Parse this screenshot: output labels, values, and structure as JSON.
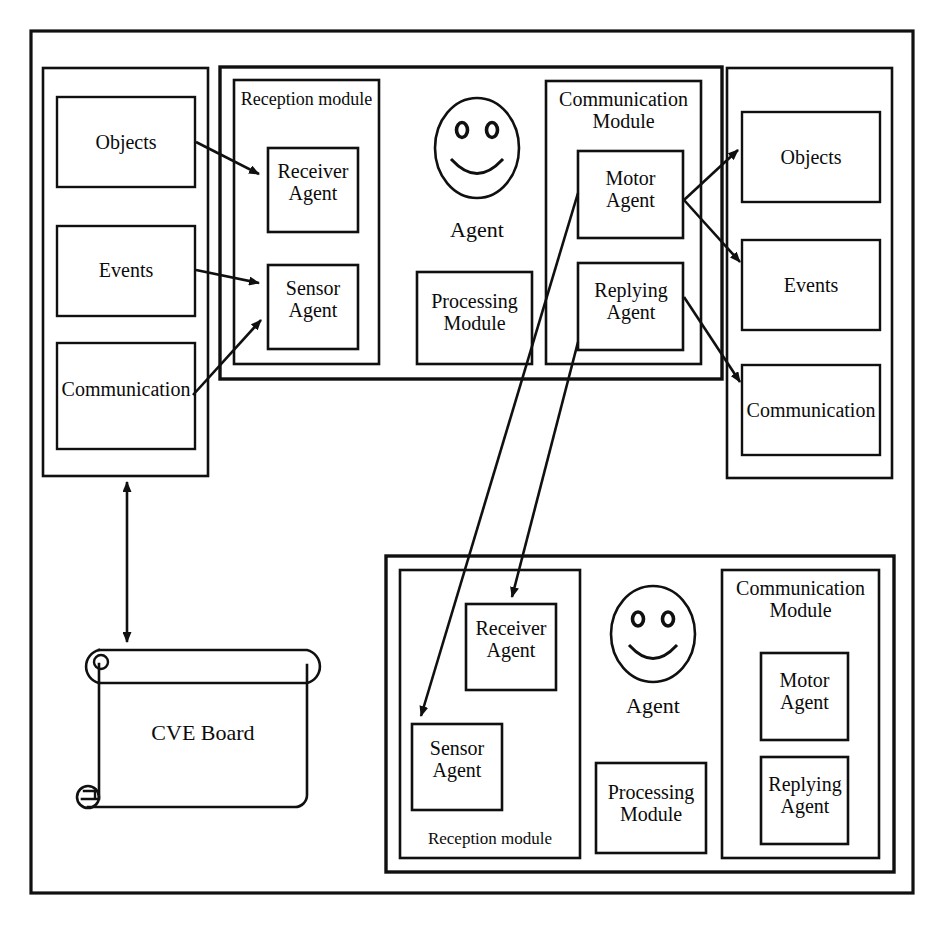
{
  "diagram": {
    "stroke_color": "#101010",
    "background_color": "#ffffff"
  },
  "left_repository": {
    "name": "left-repository-container",
    "items": [
      {
        "label": "Objects"
      },
      {
        "label": "Events"
      },
      {
        "label": "Communication"
      }
    ]
  },
  "right_repository": {
    "name": "right-repository-container",
    "items": [
      {
        "label": "Objects"
      },
      {
        "label": "Events"
      },
      {
        "label": "Communication"
      }
    ]
  },
  "top_agent": {
    "label": "Agent",
    "reception_module": {
      "label": "Reception module",
      "agents": [
        {
          "label": "Receiver\nAgent"
        },
        {
          "label": "Sensor\nAgent"
        }
      ]
    },
    "processing_module": {
      "label": "Processing\nModule"
    },
    "communication_module": {
      "label": "Communication\nModule",
      "agents": [
        {
          "label": "Motor\nAgent"
        },
        {
          "label": "Replying\nAgent"
        }
      ]
    }
  },
  "bottom_agent": {
    "label": "Agent",
    "reception_module": {
      "label": "Reception module",
      "agents": [
        {
          "label": "Receiver\nAgent"
        },
        {
          "label": "Sensor\nAgent"
        }
      ]
    },
    "processing_module": {
      "label": "Processing\nModule"
    },
    "communication_module": {
      "label": "Communication\nModule",
      "agents": [
        {
          "label": "Motor\nAgent"
        },
        {
          "label": "Replying\nAgent"
        }
      ]
    }
  },
  "cve_board": {
    "label": "CVE Board",
    "shape": "scroll"
  },
  "connections": [
    {
      "name": "objects-to-receiver-agent",
      "from": "left Objects",
      "to": "top Receiver Agent",
      "arrow": "single"
    },
    {
      "name": "events-to-sensor-agent",
      "from": "left Events",
      "to": "top Sensor Agent",
      "arrow": "single"
    },
    {
      "name": "communication-to-sensor-agent",
      "from": "left Communication",
      "to": "top Sensor Agent",
      "arrow": "single"
    },
    {
      "name": "motor-agent-to-objects",
      "from": "top Motor Agent",
      "to": "right Objects",
      "arrow": "single"
    },
    {
      "name": "motor-agent-to-events",
      "from": "top Motor Agent",
      "to": "right Events",
      "arrow": "single"
    },
    {
      "name": "replying-agent-to-communication",
      "from": "top Replying Agent",
      "to": "right Communication",
      "arrow": "single"
    },
    {
      "name": "motor-agent-to-bottom-sensor-agent",
      "from": "top Motor Agent",
      "to": "bottom Sensor Agent",
      "arrow": "single"
    },
    {
      "name": "replying-agent-to-bottom-receiver-agent",
      "from": "top Replying Agent",
      "to": "bottom Receiver Agent",
      "arrow": "single"
    },
    {
      "name": "left-repository-to-cve-board",
      "from": "left repository",
      "to": "CVE Board",
      "arrow": "double"
    }
  ]
}
